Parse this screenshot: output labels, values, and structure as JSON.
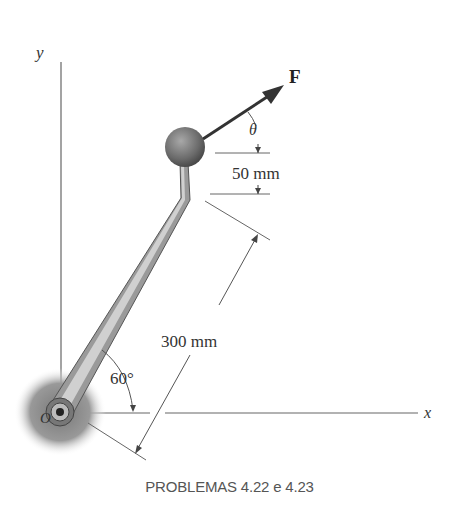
{
  "figure": {
    "axes": {
      "x_label": "x",
      "y_label": "y",
      "origin_label": "O"
    },
    "force": {
      "label": "F",
      "angle_label": "θ"
    },
    "dimensions": {
      "offset": "50 mm",
      "arm_length": "300 mm",
      "arm_angle": "60°"
    },
    "caption": "PROBLEMAS 4.22 e 4.23",
    "colors": {
      "line": "#555555",
      "arm_fill": "#b8b8b8",
      "ball": "#7a7a7a",
      "arrow": "#333333"
    }
  }
}
